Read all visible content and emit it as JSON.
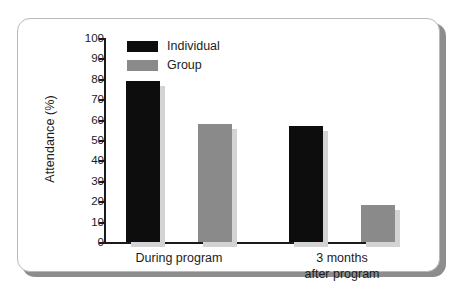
{
  "chart_data": {
    "type": "bar",
    "title": "",
    "xlabel": "",
    "ylabel": "Attendance (%)",
    "ylim": [
      0,
      100
    ],
    "ytick_step": 10,
    "yticks": [
      100,
      90,
      80,
      70,
      60,
      50,
      40,
      30,
      20,
      10,
      0
    ],
    "ytick_labels": [
      "100",
      "90",
      "80",
      "70",
      "60",
      "50",
      "40",
      "30",
      "20",
      "10",
      "0"
    ],
    "categories": [
      "During program",
      "3 months after program"
    ],
    "category_labels": [
      [
        "During program"
      ],
      [
        "3 months",
        "after program"
      ]
    ],
    "grid": false,
    "legend_position": "top-left-inside",
    "series": [
      {
        "name": "Individual",
        "color": "#0d0d0d",
        "values": [
          79,
          57
        ]
      },
      {
        "name": "Group",
        "color": "#8a8a8a",
        "values": [
          58,
          18
        ]
      }
    ]
  },
  "legend": {
    "items": [
      {
        "label": "Individual"
      },
      {
        "label": "Group"
      }
    ]
  },
  "frame": {
    "border_color": "#b9b9b9",
    "shadow_color": "#8d8d8d",
    "background": "#ffffff"
  }
}
